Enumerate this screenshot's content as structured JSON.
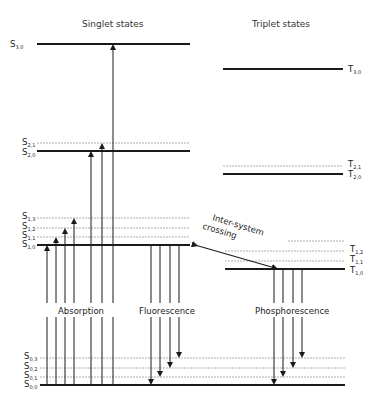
{
  "headers": {
    "singlet": "Singlet states",
    "triplet": "Triplet states"
  },
  "process_labels": {
    "absorption": "Absorption",
    "fluorescence": "Fluorescence",
    "phosphorescence": "Phosphorescence",
    "isc_line1": "Inter-system",
    "isc_line2": "crossing"
  },
  "singlet_levels": {
    "S2_1": {
      "main": "S",
      "sub": "2,1"
    },
    "S2_0": {
      "main": "S",
      "sub": "2,0"
    },
    "S3_0": {
      "main": "S",
      "sub": "3,0"
    },
    "S1_3": {
      "main": "S",
      "sub": "1,3"
    },
    "S1_2": {
      "main": "S",
      "sub": "1,2"
    },
    "S1_1": {
      "main": "S",
      "sub": "1,1"
    },
    "S1_0": {
      "main": "S",
      "sub": "1,0"
    },
    "S0_3": {
      "main": "S",
      "sub": "0,3"
    },
    "S0_2": {
      "main": "S",
      "sub": "0,2"
    },
    "S0_1": {
      "main": "S",
      "sub": "0,1"
    },
    "S0_0": {
      "main": "S",
      "sub": "0,0"
    }
  },
  "triplet_levels": {
    "T3_0": {
      "main": "T",
      "sub": "3,0"
    },
    "T2_1": {
      "main": "T",
      "sub": "2,1"
    },
    "T2_0": {
      "main": "T",
      "sub": "2,0"
    },
    "T1_2": {
      "main": "T",
      "sub": "1,2"
    },
    "T1_1": {
      "main": "T",
      "sub": "1,1"
    },
    "T1_0": {
      "main": "T",
      "sub": "1,0"
    }
  },
  "colors": {
    "line": "#1a1a1a",
    "dashed": "#888888",
    "text": "#222222"
  }
}
